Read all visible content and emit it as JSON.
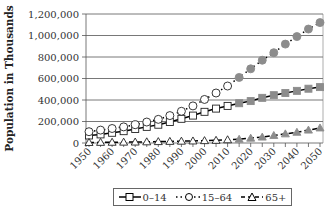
{
  "chart_data": {
    "type": "line",
    "title": "",
    "xlabel": "",
    "ylabel": "Population in Thousands",
    "ylim": [
      0,
      1200000
    ],
    "yticks": [
      "0",
      "200,000",
      "400,000",
      "600,000",
      "800,000",
      "1,000,000",
      "1,200,000"
    ],
    "xticks": [
      "1950",
      "1960",
      "1970",
      "1980",
      "1990",
      "2000",
      "2010",
      "2020",
      "2030",
      "2040",
      "2050"
    ],
    "grid": true,
    "legend_position": "bottom",
    "x": [
      1950,
      1955,
      1960,
      1965,
      1970,
      1975,
      1980,
      1985,
      1990,
      1995,
      2000,
      2005,
      2010,
      2015,
      2020,
      2025,
      2030,
      2035,
      2040,
      2045,
      2050
    ],
    "projection_start": 2015,
    "series": [
      {
        "name": "0–14",
        "marker": "square",
        "line": "solid",
        "values": [
          70000,
          80000,
          95000,
          110000,
          130000,
          150000,
          170000,
          195000,
          225000,
          255000,
          290000,
          320000,
          345000,
          370000,
          390000,
          420000,
          445000,
          465000,
          485000,
          505000,
          520000
        ]
      },
      {
        "name": "15–64",
        "marker": "circle",
        "line": "dotted",
        "values": [
          105000,
          120000,
          135000,
          150000,
          170000,
          195000,
          220000,
          255000,
          295000,
          345000,
          405000,
          465000,
          530000,
          610000,
          690000,
          770000,
          840000,
          920000,
          990000,
          1060000,
          1120000
        ]
      },
      {
        "name": "65+",
        "marker": "triangle",
        "line": "dashed",
        "values": [
          5000,
          6000,
          7000,
          8000,
          9000,
          11000,
          13000,
          15000,
          17000,
          19000,
          22000,
          25000,
          30000,
          35000,
          45000,
          55000,
          70000,
          85000,
          100000,
          120000,
          140000
        ]
      }
    ]
  },
  "legend": [
    {
      "label": "0–14"
    },
    {
      "label": "15–64"
    },
    {
      "label": "65+"
    }
  ]
}
